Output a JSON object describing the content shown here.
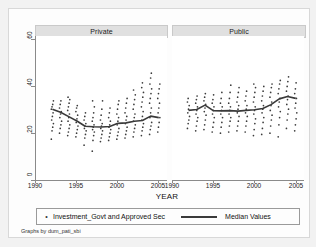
{
  "chart_data": {
    "type": "scatter",
    "title": "",
    "xlabel": "YEAR",
    "ylabel": "",
    "xlim": [
      1990,
      2006
    ],
    "ylim": [
      0,
      60
    ],
    "xticks": [
      1990,
      1995,
      2000,
      2005
    ],
    "yticks": [
      0,
      20,
      40,
      60
    ],
    "grid": false,
    "legend_position": "bottom",
    "legend": [
      {
        "name": "Investment_Govt and Approved Sec",
        "marker": "dot"
      },
      {
        "name": "Median Values",
        "marker": "line"
      }
    ],
    "note": "Graphs by dum_pati_sbi",
    "panels": [
      {
        "title": "Private",
        "x": [
          1992,
          1993,
          1994,
          1995,
          1996,
          1997,
          1998,
          1999,
          2000,
          2001,
          2002,
          2003,
          2004,
          2005
        ],
        "median": [
          29.5,
          28.2,
          26.4,
          24.6,
          22.4,
          22.2,
          22.1,
          22.3,
          23.6,
          23.8,
          24.5,
          24.8,
          26.6,
          26.0
        ],
        "scatter": [
          {
            "year": 1992,
            "values": [
              17.0,
              20.5,
              22.0,
              23.5,
              25.0,
              26.5,
              28.0,
              29.5,
              30.5,
              31.5,
              33.0
            ]
          },
          {
            "year": 1993,
            "values": [
              19.5,
              21.5,
              23.0,
              24.5,
              26.0,
              27.5,
              28.5,
              30.0,
              31.5,
              33.0
            ]
          },
          {
            "year": 1994,
            "values": [
              18.5,
              20.0,
              21.5,
              23.0,
              24.5,
              26.0,
              27.5,
              29.0,
              30.5,
              32.0,
              33.5,
              34.5
            ]
          },
          {
            "year": 1995,
            "values": [
              18.0,
              19.5,
              21.0,
              22.5,
              24.0,
              25.5,
              27.0,
              28.5,
              30.0,
              31.0
            ]
          },
          {
            "year": 1996,
            "values": [
              14.5,
              17.5,
              19.0,
              20.5,
              21.5,
              22.5,
              23.5,
              25.0,
              26.5,
              28.0
            ]
          },
          {
            "year": 1997,
            "values": [
              12.0,
              16.5,
              18.5,
              20.0,
              21.0,
              22.0,
              23.0,
              24.5,
              26.0,
              28.0,
              30.5,
              33.0
            ]
          },
          {
            "year": 1998,
            "values": [
              16.0,
              17.5,
              19.0,
              20.5,
              21.5,
              22.5,
              23.5,
              25.0,
              27.0,
              29.5,
              33.0
            ]
          },
          {
            "year": 1999,
            "values": [
              16.5,
              18.0,
              19.5,
              21.0,
              22.0,
              23.0,
              24.5,
              26.0,
              28.0,
              30.0
            ]
          },
          {
            "year": 2000,
            "values": [
              17.0,
              18.5,
              20.0,
              21.5,
              23.0,
              24.5,
              26.0,
              27.5,
              29.5,
              31.5,
              33.0
            ]
          },
          {
            "year": 2001,
            "values": [
              17.5,
              19.0,
              20.5,
              22.0,
              23.5,
              25.0,
              26.5,
              28.0,
              30.0,
              32.0,
              34.0
            ]
          },
          {
            "year": 2002,
            "values": [
              18.0,
              20.0,
              21.5,
              23.0,
              24.5,
              26.0,
              27.5,
              29.5,
              31.5,
              33.5,
              35.5,
              37.5
            ]
          },
          {
            "year": 2003,
            "values": [
              18.5,
              20.5,
              22.0,
              23.5,
              25.0,
              26.5,
              28.5,
              30.5,
              32.5,
              34.5,
              36.5,
              38.5,
              40.5
            ]
          },
          {
            "year": 2004,
            "values": [
              19.0,
              21.0,
              22.5,
              24.0,
              26.0,
              28.0,
              30.0,
              32.0,
              34.0,
              36.0,
              38.0,
              40.0,
              42.5,
              44.5
            ]
          },
          {
            "year": 2005,
            "values": [
              20.0,
              22.0,
              24.0,
              26.0,
              28.0,
              30.0,
              32.0,
              34.0,
              36.0,
              38.0,
              40.0
            ]
          }
        ]
      },
      {
        "title": "Public",
        "x": [
          1992,
          1993,
          1994,
          1995,
          1996,
          1997,
          1998,
          1999,
          2000,
          2001,
          2002,
          2003,
          2004,
          2005
        ],
        "median": [
          29.0,
          29.4,
          31.2,
          28.9,
          28.8,
          28.9,
          28.7,
          29.0,
          29.3,
          29.8,
          31.4,
          33.8,
          34.8,
          34.0
        ],
        "scatter": [
          {
            "year": 1992,
            "values": [
              21.5,
              23.5,
              25.0,
              26.5,
              28.0,
              29.5,
              31.0,
              32.5,
              34.0
            ]
          },
          {
            "year": 1993,
            "values": [
              20.5,
              22.5,
              24.5,
              26.0,
              27.5,
              29.0,
              30.5,
              32.0,
              33.5,
              35.0
            ]
          },
          {
            "year": 1994,
            "values": [
              21.0,
              23.0,
              25.0,
              27.0,
              28.5,
              30.0,
              31.5,
              33.0,
              34.5,
              36.0
            ]
          },
          {
            "year": 1995,
            "values": [
              20.0,
              22.0,
              24.0,
              26.0,
              27.5,
              29.0,
              30.5,
              32.0,
              33.5,
              35.5
            ]
          },
          {
            "year": 1996,
            "values": [
              19.5,
              22.0,
              24.0,
              26.0,
              27.5,
              29.0,
              30.5,
              32.0,
              34.0,
              36.5
            ]
          },
          {
            "year": 1997,
            "values": [
              20.0,
              22.5,
              24.5,
              26.0,
              27.5,
              29.0,
              30.5,
              32.0,
              34.0,
              36.5,
              39.5
            ]
          },
          {
            "year": 1998,
            "values": [
              20.5,
              22.5,
              24.5,
              26.5,
              28.0,
              29.5,
              31.0,
              32.5,
              34.5,
              36.5,
              38.5
            ]
          },
          {
            "year": 1999,
            "values": [
              20.0,
              22.5,
              24.5,
              26.5,
              28.0,
              29.5,
              31.0,
              33.0,
              35.0,
              37.0
            ]
          },
          {
            "year": 2000,
            "values": [
              18.5,
              21.0,
              23.5,
              25.5,
              27.5,
              29.0,
              30.5,
              32.5,
              34.5,
              36.5,
              38.5,
              40.0
            ]
          },
          {
            "year": 2001,
            "values": [
              19.0,
              21.5,
              24.0,
              26.0,
              28.0,
              29.5,
              31.0,
              33.0,
              35.0,
              37.0,
              39.0
            ]
          },
          {
            "year": 2002,
            "values": [
              19.5,
              22.5,
              25.0,
              27.0,
              29.0,
              31.0,
              32.5,
              34.5,
              36.5,
              38.5,
              40.0
            ]
          },
          {
            "year": 2003,
            "values": [
              18.0,
              23.0,
              26.0,
              28.5,
              30.5,
              32.5,
              34.0,
              36.0,
              38.0,
              40.0,
              41.5
            ]
          },
          {
            "year": 2004,
            "values": [
              21.5,
              25.0,
              27.5,
              29.5,
              31.5,
              33.5,
              35.0,
              37.0,
              39.0,
              41.0,
              43.0
            ]
          },
          {
            "year": 2005,
            "values": [
              20.5,
              23.0,
              25.5,
              28.0,
              30.0,
              32.0,
              34.0,
              36.0,
              38.0,
              40.5
            ]
          }
        ]
      }
    ]
  },
  "axis": {
    "xtitle": "YEAR",
    "xticklabels": [
      "1990",
      "1995",
      "2000",
      "2005"
    ],
    "yticklabels": [
      "0",
      "20",
      "40",
      "60"
    ]
  },
  "panels": {
    "private_title": "Private",
    "public_title": "Public"
  },
  "legend": {
    "marker_glyph": "•",
    "label_scatter": "Investment_Govt and Approved Sec",
    "label_median": "Median Values"
  },
  "footer": {
    "note": "Graphs by dum_pati_sbi"
  },
  "colors": {
    "marker": "#3c3c3c",
    "median_line": "#3a3a3a",
    "axis": "#8a8a8a",
    "strip_bg": "#e0e0e0",
    "page_bg": "#f2f2f2"
  }
}
